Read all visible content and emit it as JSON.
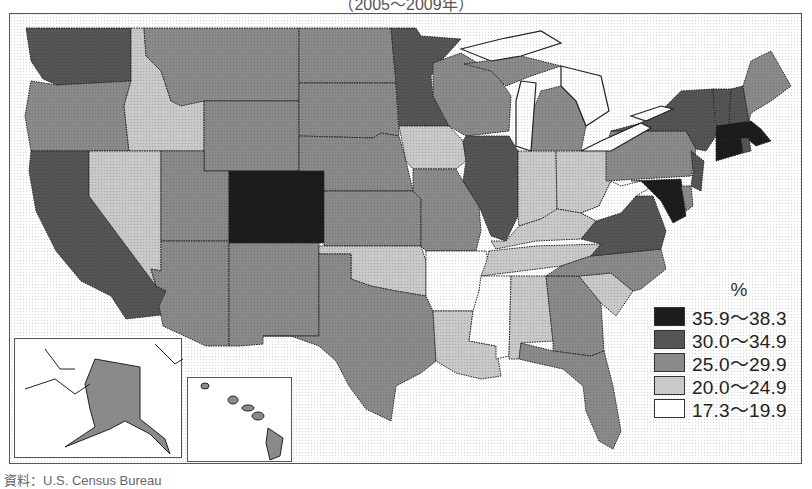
{
  "title": "（2005～2009年）",
  "caption": "資料：U.S. Census Bureau",
  "legend": {
    "unit": "%",
    "classes": [
      {
        "label": "35.9～38.3",
        "color": "#1c1c1c"
      },
      {
        "label": "30.0～34.9",
        "color": "#555555"
      },
      {
        "label": "25.0～29.9",
        "color": "#8a8a8a"
      },
      {
        "label": "20.0～24.9",
        "color": "#c9c9c9"
      },
      {
        "label": "17.3～19.9",
        "color": "#ffffff"
      }
    ]
  },
  "map_data": {
    "type": "choropleth",
    "region": "United States",
    "classes": [
      "35.9～38.3",
      "30.0～34.9",
      "25.0～29.9",
      "20.0～24.9",
      "17.3～19.9"
    ],
    "states": {
      "WA": "30.0～34.9",
      "OR": "25.0～29.9",
      "CA": "30.0～34.9",
      "ID": "20.0～24.9",
      "NV": "20.0～24.9",
      "MT": "25.0～29.9",
      "WY": "25.0～29.9",
      "UT": "25.0～29.9",
      "CO": "35.9～38.3",
      "AZ": "25.0～29.9",
      "NM": "25.0～29.9",
      "ND": "25.0～29.9",
      "SD": "25.0～29.9",
      "NE": "25.0～29.9",
      "KS": "25.0～29.9",
      "OK": "20.0～24.9",
      "TX": "25.0～29.9",
      "MN": "30.0～34.9",
      "IA": "20.0～24.9",
      "MO": "25.0～29.9",
      "AR": "17.3～19.9",
      "LA": "20.0～24.9",
      "WI": "25.0～29.9",
      "IL": "30.0～34.9",
      "MI": "25.0～29.9",
      "IN": "20.0～24.9",
      "OH": "20.0～24.9",
      "KY": "20.0～24.9",
      "TN": "20.0～24.9",
      "MS": "17.3～19.9",
      "AL": "20.0～24.9",
      "GA": "25.0～29.9",
      "FL": "25.0～29.9",
      "SC": "20.0～24.9",
      "NC": "25.0～29.9",
      "VA": "30.0～34.9",
      "WV": "17.3～19.9",
      "MD": "35.9～38.3",
      "DE": "25.0～29.9",
      "NJ": "30.0～34.9",
      "PA": "25.0～29.9",
      "NY": "30.0～34.9",
      "VT": "30.0～34.9",
      "NH": "30.0～34.9",
      "ME": "25.0～29.9",
      "MA": "35.9～38.3",
      "CT": "35.9～38.3",
      "RI": "30.0～34.9",
      "AK": "25.0～29.9",
      "HI": "25.0～29.9"
    }
  }
}
